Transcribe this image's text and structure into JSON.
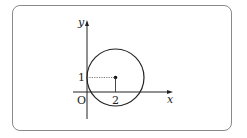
{
  "diagram": {
    "type": "coordinate-plane-circle",
    "axes": {
      "x_label": "x",
      "y_label": "y",
      "origin_label": "O"
    },
    "circle": {
      "center": [
        2,
        1
      ],
      "tangent_to": "y-axis"
    },
    "tick_labels": {
      "x_center": "2",
      "y_center": "1"
    },
    "colors": {
      "stroke": "#222222",
      "frame": "#8a8a8a",
      "dotted": "#555555"
    }
  }
}
